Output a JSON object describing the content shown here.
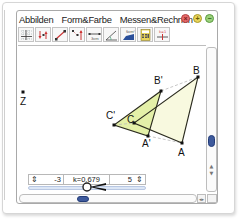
{
  "menu": {
    "items": [
      "Abbilden",
      "Form&Farbe",
      "Messen&Rechnen"
    ]
  },
  "window_buttons": {
    "close": "close-icon",
    "add": "plus-icon",
    "minimize": "minus-icon"
  },
  "toolbar": {
    "tools": [
      {
        "name": "grid-tool",
        "icon": "grid-icon"
      },
      {
        "name": "point-mirror-tool",
        "icon": "point-reflection-icon"
      },
      {
        "name": "line-segment-tool",
        "icon": "segment-icon"
      },
      {
        "name": "point-reflection-tool",
        "icon": "reflection-icon"
      },
      {
        "name": "measure-distance-tool",
        "icon": "ruler-icon"
      },
      {
        "name": "angle-tool",
        "icon": "angle-icon"
      },
      {
        "name": "area-tool",
        "icon": "area-icon"
      },
      {
        "name": "calculator-tool",
        "icon": "calculator-icon"
      },
      {
        "name": "parameter-tool",
        "icon": "parameter-icon"
      }
    ],
    "ruler_label": "3cm",
    "area_label": "5cm²"
  },
  "canvas": {
    "points": [
      {
        "label": "Z",
        "x": 22,
        "y": 81
      },
      {
        "label": "A",
        "x": 181,
        "y": 132
      },
      {
        "label": "B",
        "x": 197,
        "y": 66
      },
      {
        "label": "C",
        "x": 133,
        "y": 112
      },
      {
        "label": "A'",
        "x": 147,
        "y": 125
      },
      {
        "label": "B'",
        "x": 160,
        "y": 80
      },
      {
        "label": "C'",
        "x": 113,
        "y": 114
      }
    ],
    "colors": {
      "original_fill": "#f8f9df",
      "image_fill": "#e4f0a8",
      "edge": "#2a2a1e",
      "dashed": "#b9b9b9"
    }
  },
  "slider": {
    "min": "-3",
    "label": "k=0.679",
    "max": "5",
    "value": 0.679
  },
  "scrollbars": {
    "vertical_position": "60%",
    "horizontal_position": "32%"
  }
}
